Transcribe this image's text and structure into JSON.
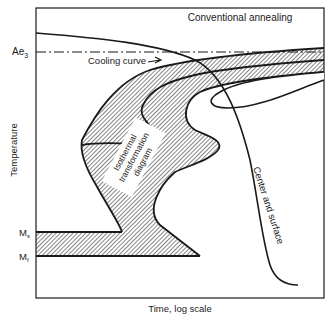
{
  "diagram": {
    "title": "Conventional annealing",
    "y_axis_label": "Temperature",
    "x_axis_label": "Time, log scale",
    "levels": {
      "ae3": {
        "label": "Ae",
        "sub": "3"
      },
      "ms": {
        "label": "M",
        "sub": "s"
      },
      "mf": {
        "label": "M",
        "sub": "f"
      }
    },
    "annotations": {
      "cooling_curve": "Cooling curve",
      "center_surface": "Center and surface",
      "itd_line1": "Isothermal",
      "itd_line2": "transformation",
      "itd_line3": "diagram"
    },
    "colors": {
      "ink": "#1a1a1a",
      "hatch": "#333333",
      "background": "#ffffff"
    }
  }
}
